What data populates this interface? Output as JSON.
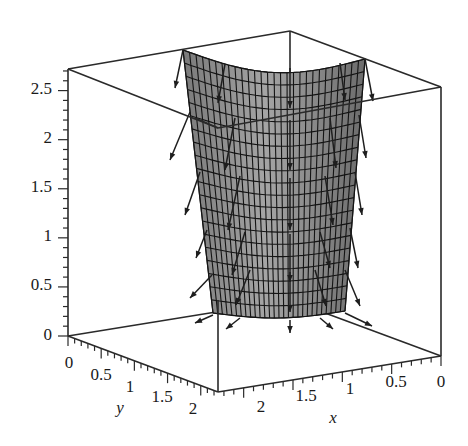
{
  "chart_data": {
    "type": "surface3d",
    "title": "",
    "xlabel": "x",
    "ylabel": "y",
    "zlabel": "",
    "xlim": [
      0,
      2.2
    ],
    "ylim": [
      0,
      2.2
    ],
    "zlim": [
      0,
      2.7
    ],
    "x_ticks": [
      "2",
      "1.5",
      "1",
      "0.5",
      "0"
    ],
    "y_ticks": [
      "0",
      "0.5",
      "1",
      "1.5",
      "2"
    ],
    "z_ticks": [
      "0",
      "0.5",
      "1",
      "1.5",
      "2",
      "2.5"
    ],
    "surface": {
      "color": "#8c8c8c",
      "grid_color": "#141414",
      "style": "patch with mesh grid",
      "rows": 20,
      "cols": 28
    },
    "vector_field": {
      "color": "#1e1e1e",
      "arrow_count": 30,
      "direction": "outward and downward from surface"
    },
    "grid": false,
    "legend": null,
    "box": true
  },
  "axes": {
    "z_tick_labels": [
      {
        "label": "2.5",
        "value": 2.5
      },
      {
        "label": "2",
        "value": 2
      },
      {
        "label": "1.5",
        "value": 1.5
      },
      {
        "label": "1",
        "value": 1
      },
      {
        "label": "0.5",
        "value": 0.5
      },
      {
        "label": "0",
        "value": 0
      }
    ],
    "y_tick_labels": [
      {
        "label": "0",
        "value": 0
      },
      {
        "label": "0.5",
        "value": 0.5
      },
      {
        "label": "1",
        "value": 1
      },
      {
        "label": "1.5",
        "value": 1.5
      },
      {
        "label": "2",
        "value": 2
      }
    ],
    "x_tick_labels": [
      {
        "label": "2",
        "value": 2
      },
      {
        "label": "1.5",
        "value": 1.5
      },
      {
        "label": "1",
        "value": 1
      },
      {
        "label": "0.5",
        "value": 0.5
      },
      {
        "label": "0",
        "value": 0
      }
    ],
    "x_axis_title": "x",
    "y_axis_title": "y"
  }
}
